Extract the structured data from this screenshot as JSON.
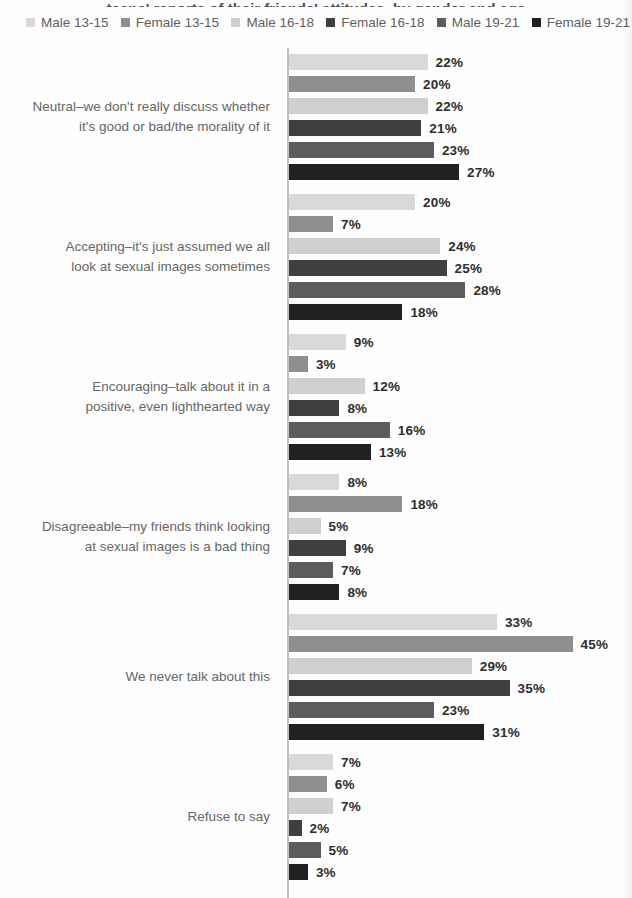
{
  "cropped_title_fragment": "teens' reports of their friends' attitudes, by gender and age",
  "chart_data": {
    "type": "bar",
    "orientation": "horizontal",
    "value_unit": "%",
    "axis_range": [
      0,
      45
    ],
    "grid": false,
    "legend_position": "top",
    "axis_color": "#bfbfbf",
    "categories": [
      "Neutral–we don't really discuss whether\nit's good or bad/the morality of it",
      "Accepting–it's just assumed we all\nlook at sexual images sometimes",
      "Encouraging–talk about it in a\npositive, even lighthearted way",
      "Disagreeable–my friends think looking\nat sexual images is a bad thing",
      "We never talk about this",
      "Refuse to say"
    ],
    "series": [
      {
        "name": "Male 13-15",
        "color": "#d9d9d9",
        "values": [
          22,
          20,
          9,
          8,
          33,
          7
        ]
      },
      {
        "name": "Female 13-15",
        "color": "#8f8f8f",
        "values": [
          20,
          7,
          3,
          18,
          45,
          6
        ]
      },
      {
        "name": "Male 16-18",
        "color": "#cfcfcf",
        "values": [
          22,
          24,
          12,
          5,
          29,
          7
        ]
      },
      {
        "name": "Female 16-18",
        "color": "#3f3f3f",
        "values": [
          21,
          25,
          8,
          9,
          35,
          2
        ]
      },
      {
        "name": "Male 19-21",
        "color": "#5d5d5d",
        "values": [
          23,
          28,
          16,
          7,
          23,
          5
        ]
      },
      {
        "name": "Female 19-21",
        "color": "#212121",
        "values": [
          27,
          18,
          13,
          8,
          31,
          3
        ]
      }
    ]
  }
}
